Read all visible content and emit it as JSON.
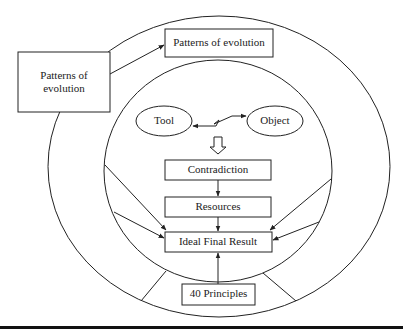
{
  "diagram": {
    "left_box": {
      "line1": "Patterns of",
      "line2": "evolution"
    },
    "top_box": "Patterns of evolution",
    "tool": "Tool",
    "object": "Object",
    "contradiction": "Contradiction",
    "resources": "Resources",
    "ifr": "Ideal Final Result",
    "principles": "40 Principles"
  },
  "colors": {
    "stroke": "#222222",
    "background": "#ffffff",
    "rule": "#111111"
  }
}
